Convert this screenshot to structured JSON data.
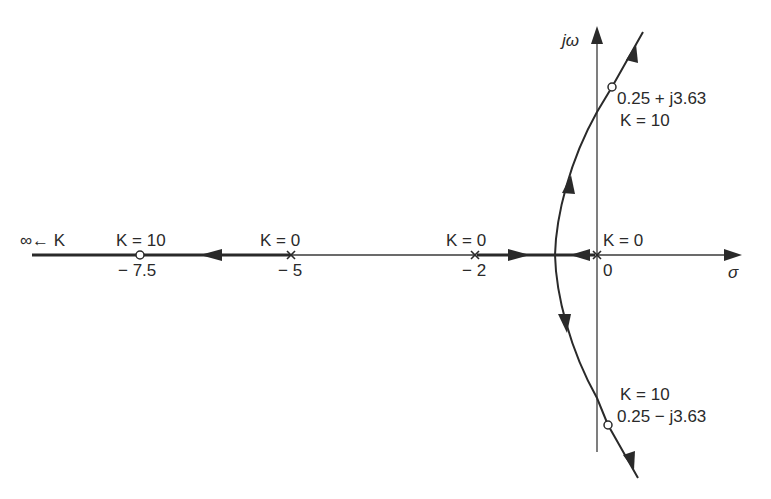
{
  "figure": {
    "type": "root-locus",
    "axes": {
      "real_label": "σ",
      "imag_label": "jω"
    },
    "real_axis_ticks": [
      {
        "value": -7.5,
        "label": "− 7.5"
      },
      {
        "value": -5,
        "label": "− 5"
      },
      {
        "value": -2,
        "label": "− 2"
      },
      {
        "value": 0,
        "label": "0"
      }
    ],
    "poles": [
      {
        "location": 0,
        "label": "K = 0"
      },
      {
        "location": -2,
        "label": "K = 0"
      },
      {
        "location": -5,
        "label": "K = 0"
      }
    ],
    "marked_points": [
      {
        "location": "-7.5",
        "label_k": "K = 10"
      },
      {
        "location": "0.25 + j3.63",
        "label_value": "0.25 + j3.63",
        "label_k": "K = 10"
      },
      {
        "location": "0.25 − j3.63",
        "label_value": "0.25 − j3.63",
        "label_k": "K = 10"
      }
    ],
    "infinity_label": "∞ ← K",
    "breakaway_sigma": -0.69,
    "branches": [
      "Real axis: from pole −5 to −∞ (K increasing)",
      "Real axis: from poles −2 and 0 meet at breakaway ≈ −0.69",
      "Complex branches: depart breakaway, cross jω axis, asymptote to upper/lower right"
    ]
  },
  "labels": {
    "jw": "jω",
    "sigma": "σ",
    "inf_k": "∞← K",
    "k10_left": "K = 10",
    "k0_m5": "K = 0",
    "k0_m2": "K = 0",
    "k0_0": "K = 0",
    "tick_m75": "− 7.5",
    "tick_m5": "− 5",
    "tick_m2": "− 2",
    "tick_0": "0",
    "upper_value": "0.25 + j3.63",
    "upper_k": "K = 10",
    "lower_k": "K = 10",
    "lower_value": "0.25 − j3.63"
  }
}
